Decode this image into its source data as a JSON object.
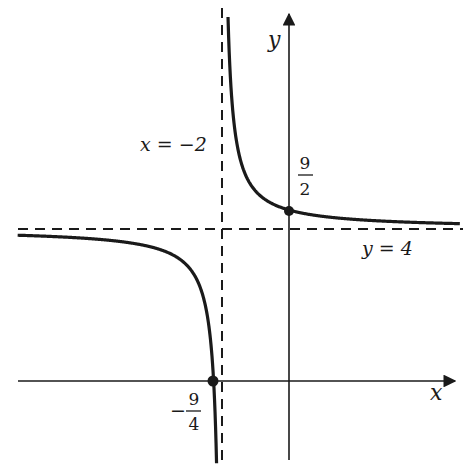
{
  "chart_data": {
    "type": "line",
    "title": "",
    "function": "y = 4 + 1/(x + 2)",
    "xlabel": "x",
    "ylabel": "y",
    "asymptotes": {
      "vertical": {
        "x": -2,
        "label": "x = −2"
      },
      "horizontal": {
        "y": 4,
        "label": "y = 4"
      }
    },
    "points": [
      {
        "name": "y-intercept",
        "x": 0,
        "y": 4.5,
        "label_num": "9",
        "label_den": "2",
        "label_sign": ""
      },
      {
        "name": "x-intercept",
        "x": -2.25,
        "y": 0,
        "label_num": "9",
        "label_den": "4",
        "label_sign": "−"
      }
    ],
    "xlim": [
      -8.6,
      5.2
    ],
    "ylim": [
      -2.2,
      10
    ],
    "grid": false,
    "legend": "none"
  },
  "colors": {
    "curve": "#1a1a1a",
    "axis": "#1a1a1a",
    "background": "#ffffff"
  },
  "labels": {
    "x_axis": "x",
    "y_axis": "y",
    "vert_asym": "x = −2",
    "horiz_asym": "y = 4"
  }
}
